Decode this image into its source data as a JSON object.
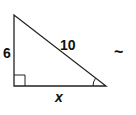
{
  "diagram": {
    "type": "right-triangle",
    "labels": {
      "vertical_leg": "6",
      "hypotenuse": "10",
      "horizontal_leg": "x",
      "side_mark": "~"
    },
    "stroke_color": "#222222",
    "right_angle_marker": true,
    "angle_arc_marker": "bottom-right"
  }
}
